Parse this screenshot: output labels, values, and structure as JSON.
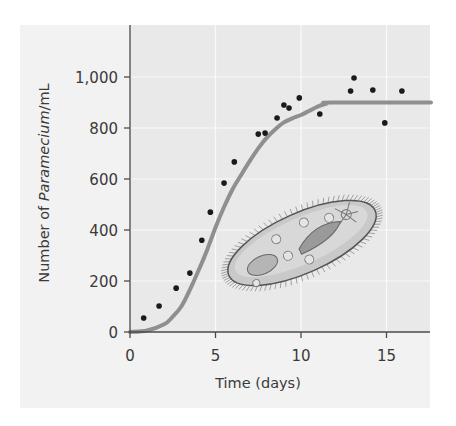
{
  "chart_data": {
    "type": "scatter",
    "title": "",
    "xlabel": "Time (days)",
    "ylabel_parts": {
      "prefix": "Number of ",
      "italic": "Paramecium",
      "suffix": "/mL"
    },
    "ylabel": "Number of Paramecium/mL",
    "xlim": [
      0,
      17.6
    ],
    "ylim": [
      0,
      1200
    ],
    "x_ticks": [
      0,
      5,
      10,
      15
    ],
    "x_tick_labels": [
      "0",
      "5",
      "10",
      "15"
    ],
    "y_ticks": [
      0,
      200,
      400,
      600,
      800,
      1000
    ],
    "y_tick_labels": [
      "0",
      "200",
      "400",
      "600",
      "800",
      "1,000"
    ],
    "grid": true,
    "series": [
      {
        "name": "Observed population",
        "kind": "scatter",
        "color": "#1a1a1a",
        "points": [
          [
            0.8,
            55
          ],
          [
            1.7,
            102
          ],
          [
            2.7,
            172
          ],
          [
            3.5,
            231
          ],
          [
            4.2,
            360
          ],
          [
            4.7,
            470
          ],
          [
            5.5,
            584
          ],
          [
            6.1,
            667
          ],
          [
            7.5,
            776
          ],
          [
            7.9,
            780
          ],
          [
            8.6,
            839
          ],
          [
            9.0,
            890
          ],
          [
            9.3,
            878
          ],
          [
            9.9,
            918
          ],
          [
            11.1,
            855
          ],
          [
            12.9,
            945
          ],
          [
            13.1,
            996
          ],
          [
            14.2,
            949
          ],
          [
            14.9,
            820
          ],
          [
            15.9,
            945
          ]
        ]
      },
      {
        "name": "Logistic growth curve",
        "kind": "line",
        "color": "#8f8f8f",
        "carrying_capacity": 900,
        "points": [
          [
            0,
            0
          ],
          [
            1,
            6
          ],
          [
            2,
            30
          ],
          [
            2.5,
            60
          ],
          [
            3,
            100
          ],
          [
            3.5,
            165
          ],
          [
            4,
            240
          ],
          [
            4.5,
            320
          ],
          [
            5,
            410
          ],
          [
            5.5,
            490
          ],
          [
            6,
            560
          ],
          [
            6.5,
            616
          ],
          [
            7,
            670
          ],
          [
            7.5,
            720
          ],
          [
            8,
            762
          ],
          [
            8.5,
            795
          ],
          [
            9,
            822
          ],
          [
            9.5,
            838
          ],
          [
            10,
            851
          ],
          [
            10.5,
            868
          ],
          [
            11,
            885
          ],
          [
            11.5,
            896
          ],
          [
            11.8,
            900
          ],
          [
            17.6,
            900
          ]
        ]
      }
    ],
    "annotations": [
      {
        "kind": "illustration",
        "subject": "paramecium",
        "position": "lower-right of curve"
      }
    ]
  },
  "colors": {
    "panel_bg": "#f2f2f2",
    "plot_bg": "#e9e9e9",
    "gridline": "#fafafa",
    "axis": "#4a4a4a",
    "text": "#3a3a3a"
  }
}
